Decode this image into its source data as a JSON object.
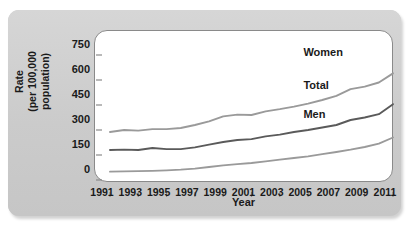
{
  "figure": {
    "panel_bg": "#cfcfcf",
    "plot_bg": "#ffffff",
    "axis_color": "#8a8a8a"
  },
  "chart_data": {
    "type": "line",
    "title": "",
    "xlabel": "Year",
    "ylabel": "Rate\n(per 100,000 population)",
    "ylabel_line1": "Rate",
    "ylabel_line2": "(per 100,000 population)",
    "grid": false,
    "legend_position": "inline-right",
    "xlim": [
      1991,
      2011
    ],
    "ylim": [
      0,
      780
    ],
    "yticks": [
      0,
      150,
      300,
      450,
      600,
      750
    ],
    "ytick_labels": [
      "0",
      "150",
      "300",
      "450",
      "600",
      "750"
    ],
    "xticks": [
      1991,
      1993,
      1995,
      1997,
      1999,
      2001,
      2003,
      2005,
      2007,
      2009,
      2011
    ],
    "xtick_labels": [
      "1991",
      "1993",
      "1995",
      "1997",
      "1999",
      "2001",
      "2003",
      "2005",
      "2007",
      "2009",
      "2011"
    ],
    "x": [
      1991,
      1992,
      1993,
      1994,
      1995,
      1996,
      1997,
      1998,
      1999,
      2000,
      2001,
      2002,
      2003,
      2004,
      2005,
      2006,
      2007,
      2008,
      2009,
      2010,
      2011
    ],
    "series": [
      {
        "name": "Women",
        "color": "#9a9a9a",
        "values": [
          288,
          300,
          296,
          305,
          305,
          312,
          330,
          352,
          382,
          392,
          390,
          412,
          425,
          440,
          458,
          480,
          505,
          545,
          560,
          585,
          640
        ]
      },
      {
        "name": "Total",
        "color": "#5a5a5a",
        "values": [
          180,
          182,
          180,
          192,
          185,
          185,
          196,
          212,
          228,
          240,
          245,
          262,
          272,
          288,
          300,
          315,
          330,
          360,
          375,
          395,
          455
        ]
      },
      {
        "name": "Men",
        "color": "#9a9a9a",
        "values": [
          50,
          52,
          53,
          55,
          58,
          62,
          68,
          78,
          88,
          95,
          102,
          112,
          122,
          132,
          142,
          155,
          168,
          182,
          198,
          218,
          255
        ]
      }
    ],
    "annotations": [
      {
        "text": "Women",
        "x": 2008.2,
        "y": 700
      },
      {
        "text": "Total",
        "x": 2008.2,
        "y": 505
      },
      {
        "text": "Men",
        "x": 2008.2,
        "y": 330
      }
    ]
  }
}
